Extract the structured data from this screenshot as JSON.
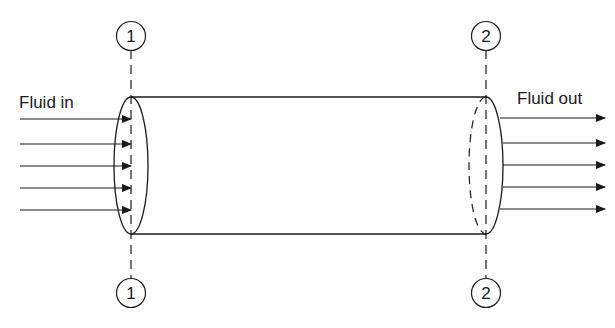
{
  "diagram": {
    "labels": {
      "inlet": "Fluid in",
      "outlet": "Fluid out"
    },
    "sections": [
      {
        "id": "1",
        "label": "1",
        "x": 131
      },
      {
        "id": "2",
        "label": "2",
        "x": 486
      }
    ],
    "tube": {
      "top_y": 97,
      "bottom_y": 234
    },
    "inlet_arrows": [
      119,
      144,
      166,
      188,
      210
    ],
    "outlet_arrows": [
      118,
      143,
      165,
      187,
      209
    ],
    "colors": {
      "stroke": "#1a1a1a",
      "background": "#ffffff"
    }
  }
}
